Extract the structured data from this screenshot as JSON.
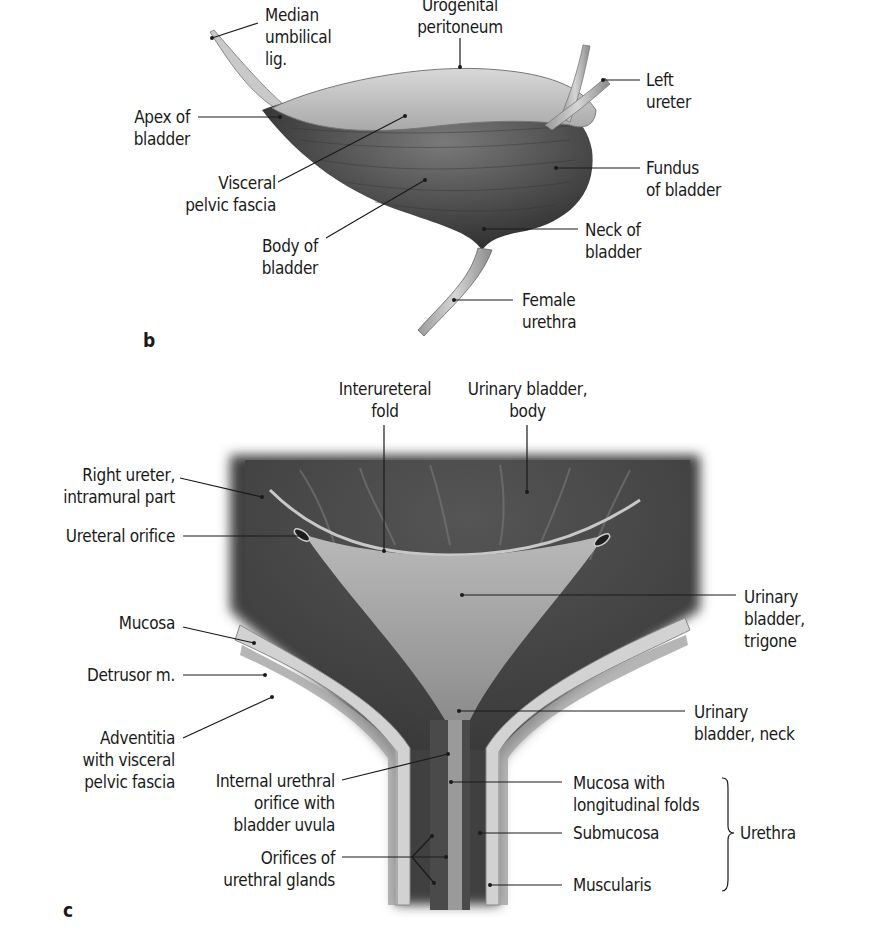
{
  "figure": {
    "panels": [
      {
        "id": "b",
        "letter": "b",
        "labels": {
          "median_umbilical_lig": "Median\numbilical\nlig.",
          "urogenital_peritoneum": "Urogenital\nperitoneum",
          "left_ureter": "Left\nureter",
          "apex_of_bladder": "Apex of\nbladder",
          "visceral_pelvic_fascia": "Visceral\npelvic fascia",
          "fundus_of_bladder": "Fundus\nof bladder",
          "body_of_bladder": "Body of\nbladder",
          "neck_of_bladder": "Neck of\nbladder",
          "female_urethra": "Female\nurethra"
        }
      },
      {
        "id": "c",
        "letter": "c",
        "labels": {
          "interureteral_fold": "Interureteral\nfold",
          "urinary_bladder_body": "Urinary bladder,\nbody",
          "right_ureter_intramural": "Right ureter,\nintramural part",
          "ureteral_orifice": "Ureteral orifice",
          "urinary_bladder_trigone": "Urinary\nbladder,\ntrigone",
          "mucosa": "Mucosa",
          "detrusor": "Detrusor m.",
          "adventitia": "Adventitia\nwith visceral\npelvic fascia",
          "urinary_bladder_neck": "Urinary\nbladder, neck",
          "internal_urethral_orifice": "Internal urethral\norifice with\nbladder uvula",
          "mucosa_longitudinal_folds": "Mucosa with\nlongitudinal folds",
          "submucosa": "Submucosa",
          "orifices_urethral_glands": "Orifices of\nurethral glands",
          "muscularis": "Muscularis",
          "urethra_group": "Urethra"
        }
      }
    ]
  }
}
